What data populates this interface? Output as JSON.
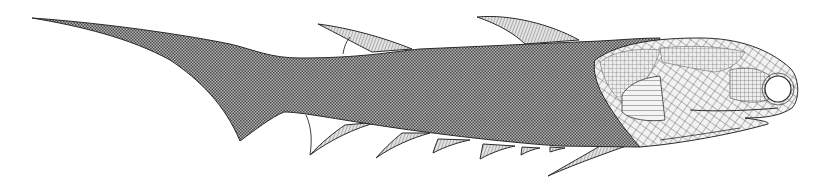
{
  "figure": {
    "colors": {
      "background": "#ffffff",
      "outline": "#2a2a2a",
      "body_fill": "#9a9a9a",
      "fin_fill": "#c8c8c8",
      "head_fill": "#e2e2e2",
      "eye_fill": "#ffffff"
    }
  }
}
